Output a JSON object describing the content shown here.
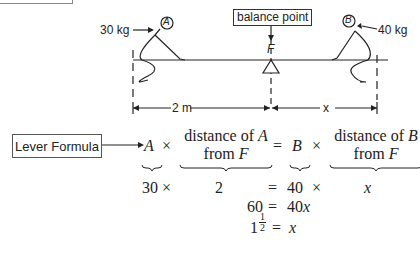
{
  "diagram": {
    "balance_label": "balance point",
    "fulcrum_label": "F",
    "person_a": {
      "label": "A",
      "weight": "30 kg"
    },
    "person_b": {
      "label": "B",
      "weight": "40 kg"
    },
    "distance_left": "2 m",
    "distance_right": "x"
  },
  "formula": {
    "box_label": "Lever Formula",
    "line1": {
      "a": "A",
      "times1": "×",
      "dist_a_top": "distance of ",
      "dist_a_var": "A",
      "dist_a_bottom": "from ",
      "dist_a_f": "F",
      "equals": "=",
      "b": "B",
      "times2": "×",
      "dist_b_top": "distance of ",
      "dist_b_var": "B",
      "dist_b_bottom": "from ",
      "dist_b_f": "F"
    },
    "line2": {
      "a_val": "30",
      "times1": "×",
      "dist_a_val": "2",
      "equals": "=",
      "b_val": "40",
      "times2": "×",
      "dist_b_val": "x"
    },
    "line3": {
      "left": "60",
      "equals": "=",
      "right": "40x"
    },
    "line4": {
      "whole": "1",
      "num": "1",
      "den": "2",
      "equals": "=",
      "right": "x"
    }
  }
}
